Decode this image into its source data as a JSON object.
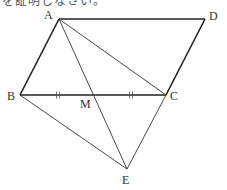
{
  "header": {
    "clipped_text": "を証明しなさい。"
  },
  "figure": {
    "points": {
      "A": {
        "label": "A",
        "x": 59,
        "y": 19
      },
      "B": {
        "label": "B",
        "x": 20,
        "y": 95
      },
      "C": {
        "label": "C",
        "x": 166,
        "y": 95
      },
      "D": {
        "label": "D",
        "x": 205,
        "y": 19
      },
      "M": {
        "label": "M",
        "x": 93,
        "y": 95
      },
      "E": {
        "label": "E",
        "x": 127,
        "y": 169
      }
    },
    "segments": [
      {
        "from": "A",
        "to": "D",
        "weight": "thick"
      },
      {
        "from": "A",
        "to": "B",
        "weight": "thick"
      },
      {
        "from": "B",
        "to": "C",
        "weight": "thick"
      },
      {
        "from": "D",
        "to": "C",
        "weight": "thick"
      },
      {
        "from": "A",
        "to": "C",
        "weight": "thin"
      },
      {
        "from": "A",
        "to": "E",
        "weight": "thin",
        "through": "M"
      },
      {
        "from": "B",
        "to": "E",
        "weight": "thin"
      },
      {
        "from": "C",
        "to": "E",
        "weight": "thin"
      }
    ],
    "equal_marks": [
      {
        "segment": "BM",
        "marks": 2
      },
      {
        "segment": "MC",
        "marks": 2
      }
    ],
    "shape": "parallelogram ABCD",
    "line_color": "#222222"
  }
}
